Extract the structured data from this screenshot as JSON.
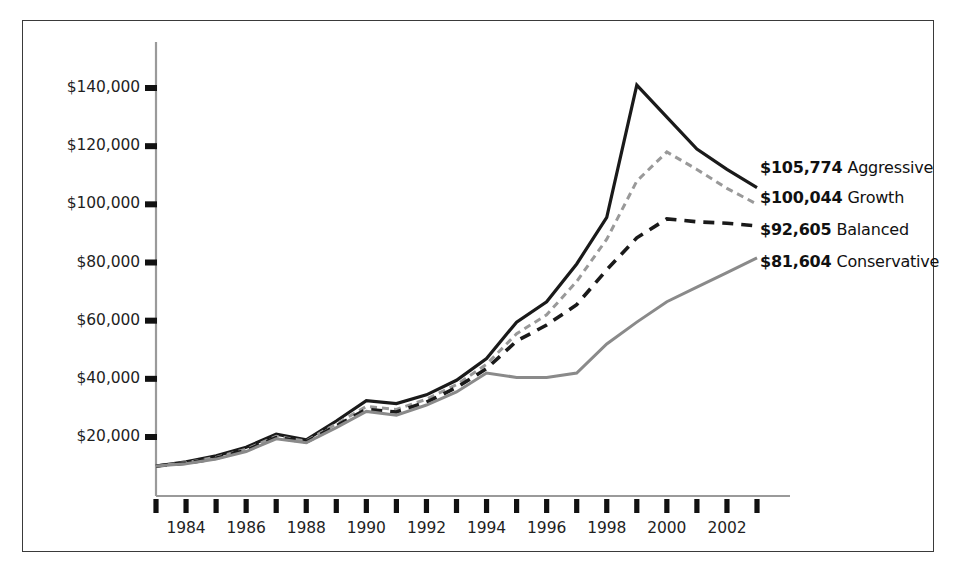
{
  "chart_data": {
    "type": "line",
    "title": "",
    "subtitle": "",
    "xlabel": "",
    "ylabel": "",
    "xlim": [
      1983,
      2003
    ],
    "ylim": [
      0,
      150000
    ],
    "grid": false,
    "legend_position": "end-of-line",
    "x": [
      1983,
      1984,
      1985,
      1986,
      1987,
      1988,
      1989,
      1990,
      1991,
      1992,
      1993,
      1994,
      1995,
      1996,
      1997,
      1998,
      1999,
      2000,
      2001,
      2002,
      2003
    ],
    "x_tick_labels": [
      "1984",
      "1986",
      "1988",
      "1990",
      "1992",
      "1994",
      "1996",
      "1998",
      "2000",
      "2002"
    ],
    "x_tick_values": [
      1984,
      1986,
      1988,
      1990,
      1992,
      1994,
      1996,
      1998,
      2000,
      2002
    ],
    "y_tick_labels": [
      "$20,000",
      "$40,000",
      "$60,000",
      "$80,000",
      "$100,000",
      "$120,000",
      "$140,000"
    ],
    "y_tick_values": [
      20000,
      40000,
      60000,
      80000,
      100000,
      120000,
      140000
    ],
    "series": [
      {
        "name": "Aggressive",
        "end_value_label": "$105,774",
        "end_value": 105774,
        "color": "#1a1a1a",
        "style": "solid",
        "width": 3.2,
        "values": [
          10000,
          11500,
          13500,
          16500,
          21000,
          19000,
          25500,
          32500,
          31500,
          34500,
          39500,
          47000,
          59500,
          66500,
          79500,
          95500,
          141000,
          130000,
          119000,
          112000,
          105774
        ]
      },
      {
        "name": "Growth",
        "end_value_label": "$100,044",
        "end_value": 100044,
        "color": "#999999",
        "style": "dashed-fine",
        "width": 3.0,
        "values": [
          10000,
          11200,
          13000,
          15800,
          20200,
          18600,
          24500,
          30500,
          29500,
          33000,
          38000,
          45000,
          55500,
          62000,
          73500,
          88000,
          108000,
          118000,
          112000,
          105500,
          100044
        ]
      },
      {
        "name": "Balanced",
        "end_value_label": "$92,605",
        "end_value": 92605,
        "color": "#1a1a1a",
        "style": "dashed-bold",
        "width": 3.6,
        "values": [
          10000,
          11000,
          12700,
          15400,
          19800,
          18300,
          23800,
          29500,
          28600,
          32000,
          37000,
          43500,
          53000,
          58500,
          65500,
          77500,
          88500,
          95000,
          94000,
          93500,
          92605
        ]
      },
      {
        "name": "Conservative",
        "end_value_label": "$81,604",
        "end_value": 81604,
        "color": "#8a8a8a",
        "style": "solid",
        "width": 3.0,
        "values": [
          10000,
          10800,
          12400,
          15000,
          19400,
          18000,
          23200,
          28800,
          27500,
          31000,
          35500,
          42000,
          40500,
          40500,
          42000,
          52000,
          59500,
          66500,
          71500,
          76500,
          81604
        ]
      }
    ]
  },
  "axis": {
    "y_labels": [
      "$140,000",
      "$120,000",
      "$100,000",
      "$80,000",
      "$60,000",
      "$40,000",
      "$20,000"
    ],
    "x_labels": [
      "1984",
      "1986",
      "1988",
      "1990",
      "1992",
      "1994",
      "1996",
      "1998",
      "2000",
      "2002"
    ]
  },
  "end_labels": [
    {
      "value": "$105,774",
      "name": "Aggressive"
    },
    {
      "value": "$100,044",
      "name": "Growth"
    },
    {
      "value": "$92,605",
      "name": "Balanced"
    },
    {
      "value": "$81,604",
      "name": "Conservative"
    }
  ]
}
